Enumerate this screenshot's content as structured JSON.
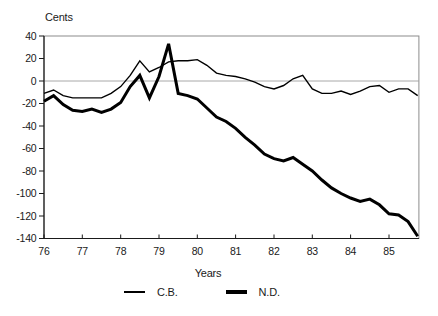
{
  "figure": {
    "background": "#ffffff"
  },
  "colors": {
    "series_line": "#000000",
    "frame": "#8c8c8c",
    "zero_gridline": "#9e9e9e",
    "axis": "#1a1a1a",
    "text": "#1a1a1a"
  },
  "legend": {
    "items": [
      "C.B.",
      "N.D."
    ]
  },
  "chart_data": {
    "type": "line",
    "title": "",
    "ylabel": "Cents",
    "xlabel": "Years",
    "ylim": [
      -140,
      40
    ],
    "xlim": [
      76,
      85.78
    ],
    "yticks": [
      40,
      20,
      0,
      -20,
      -40,
      -60,
      -80,
      -100,
      -120,
      -140
    ],
    "ytick_labels": [
      "40",
      "20",
      "0",
      "-20",
      "-40",
      "-60",
      "-80",
      "-100",
      "-120",
      "-140"
    ],
    "xticks": [
      76,
      77,
      78,
      79,
      80,
      81,
      82,
      83,
      84,
      85
    ],
    "xtick_labels": [
      "76",
      "77",
      "78",
      "79",
      "80",
      "81",
      "82",
      "83",
      "84",
      "85"
    ],
    "grid": "zero-line-only",
    "legend_position": "bottom",
    "x": [
      76,
      76.25,
      76.5,
      76.75,
      77,
      77.25,
      77.5,
      77.75,
      78,
      78.25,
      78.5,
      78.75,
      79,
      79.25,
      79.5,
      79.75,
      80,
      80.25,
      80.5,
      80.75,
      81,
      81.25,
      81.5,
      81.75,
      82,
      82.25,
      82.5,
      82.75,
      83,
      83.25,
      83.5,
      83.75,
      84,
      84.25,
      84.5,
      84.75,
      85,
      85.25,
      85.5,
      85.75
    ],
    "series": [
      {
        "name": "C.B.",
        "style": "thin",
        "stroke_width": 1.4,
        "values": [
          -11,
          -8,
          -13,
          -15,
          -15,
          -15,
          -15,
          -11,
          -5,
          5,
          18,
          8,
          12,
          17,
          18,
          18,
          19,
          14,
          7,
          5,
          4,
          2,
          -1,
          -5,
          -7,
          -4,
          2,
          5,
          -7,
          -11,
          -11,
          -9,
          -12,
          -9,
          -5,
          -4,
          -10,
          -7,
          -7,
          -13
        ]
      },
      {
        "name": "N.D.",
        "style": "thick",
        "stroke_width": 3,
        "values": [
          -18,
          -13,
          -21,
          -26,
          -27,
          -25,
          -28,
          -25,
          -19,
          -5,
          5,
          -15,
          4,
          33,
          -11,
          -13,
          -16,
          -24,
          -32,
          -36,
          -42,
          -50,
          -57,
          -65,
          -69,
          -71,
          -68,
          -74,
          -80,
          -88,
          -95,
          -100,
          -104,
          -107,
          -105,
          -110,
          -118,
          -119,
          -125,
          -138
        ]
      }
    ]
  }
}
